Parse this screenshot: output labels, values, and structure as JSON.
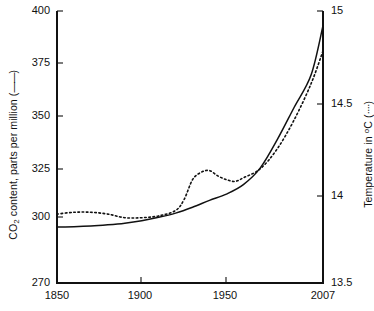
{
  "chart_data": {
    "type": "line",
    "title": "",
    "xlabel": "",
    "xlim": [
      1850,
      2007
    ],
    "xticks": [
      1850,
      1900,
      1950,
      2007
    ],
    "xtick_labels": [
      "1850",
      "1900",
      "1950",
      "2007"
    ],
    "grid": false,
    "legend_position": "in-axis-labels",
    "axes": [
      {
        "side": "left",
        "label": "CO2 content, parts per million ( —— )",
        "label_main": "CO",
        "label_sub": "2",
        "label_rest": " content, parts per million (",
        "label_glyph": "——",
        "label_close": ")",
        "ylim": [
          270,
          400
        ],
        "yticks": [
          270,
          300,
          325,
          350,
          375,
          400
        ],
        "ytick_labels": [
          "270",
          "300",
          "325",
          "350",
          "375",
          "400"
        ],
        "series_name": "CO2 content",
        "line_style": "solid"
      },
      {
        "side": "right",
        "label": "Temperature in °C ( ···· )",
        "label_main": "Temperature in ",
        "label_sup": "o",
        "label_rest": "C (",
        "label_glyph": "····",
        "label_close": ")",
        "ylim": [
          13.5,
          15.0
        ],
        "yticks": [
          13.5,
          14,
          14.5,
          15
        ],
        "ytick_labels": [
          "13.5",
          "14",
          "14.5",
          "15"
        ],
        "series_name": "Temperature",
        "line_style": "dotted"
      }
    ],
    "series": [
      {
        "name": "CO2 content",
        "axis": "left",
        "style": "solid",
        "color": "#111111",
        "units": "parts per million",
        "x": [
          1850,
          1860,
          1870,
          1880,
          1890,
          1900,
          1910,
          1920,
          1930,
          1940,
          1950,
          1960,
          1970,
          1980,
          1990,
          2000,
          2007
        ],
        "values": [
          296.8,
          296.9,
          297.2,
          297.8,
          298.6,
          299.8,
          301.4,
          303.4,
          306.2,
          309.5,
          312.5,
          317.0,
          325.0,
          338.5,
          354.0,
          369.5,
          393.0
        ]
      },
      {
        "name": "Temperature",
        "axis": "right",
        "style": "dotted",
        "color": "#111111",
        "units": "°C",
        "x": [
          1850,
          1860,
          1870,
          1880,
          1890,
          1900,
          1910,
          1920,
          1925,
          1930,
          1935,
          1940,
          1945,
          1950,
          1955,
          1960,
          1970,
          1980,
          1990,
          2000,
          2007
        ],
        "values": [
          13.88,
          13.89,
          13.89,
          13.88,
          13.86,
          13.86,
          13.87,
          13.9,
          13.96,
          14.07,
          14.11,
          14.12,
          14.09,
          14.07,
          14.06,
          14.08,
          14.13,
          14.24,
          14.4,
          14.6,
          14.78
        ]
      }
    ],
    "annotations": []
  },
  "figure": {
    "background_color": "#ffffff",
    "axis_color": "#111111",
    "plot_area": {
      "left": 57,
      "right": 323,
      "top": 11,
      "bottom": 283
    }
  }
}
